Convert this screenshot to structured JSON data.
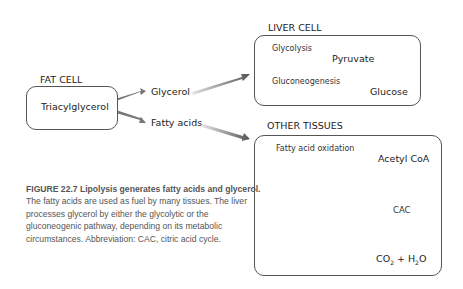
{
  "fat_cell": {
    "title": "FAT CELL",
    "box_label": "Triacylglycerol"
  },
  "products": {
    "glycerol": "Glycerol",
    "fatty_acids": "Fatty acids"
  },
  "liver_cell": {
    "title": "LIVER CELL",
    "pathway1": {
      "label": "Glycolysis",
      "product": "Pyruvate"
    },
    "pathway2": {
      "label": "Gluconeogenesis",
      "product": "Glucose"
    }
  },
  "other_tissues": {
    "title": "OTHER TISSUES",
    "pathway": {
      "label": "Fatty acid oxidation",
      "product": "Acetyl CoA"
    },
    "cycle": "CAC",
    "end_products": {
      "co2": "CO",
      "sub2": "2",
      "plus": " + H",
      "sub2b": "2",
      "o": "O"
    }
  },
  "caption": {
    "bold": "FIGURE 22.7  Lipolysis generates fatty acids and glycerol.",
    "text": " The fatty acids are used as fuel by many tissues. The liver processes glycerol by either the glycolytic or the gluconeogenic pathway, depending on its metabolic circumstances. Abbreviation: CAC, citric acid cycle."
  },
  "colors": {
    "arrow_dark": "#5a5a5a",
    "arrow_light": "#e2e2e2",
    "border": "#555555",
    "cycle": "#4a4a4a"
  }
}
